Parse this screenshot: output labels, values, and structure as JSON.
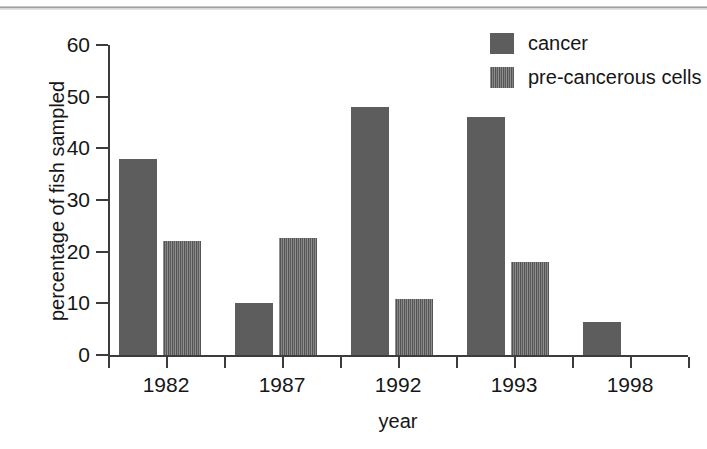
{
  "figure": {
    "background_color": "#ffffff",
    "scan_rule_color": "#8d8d8d"
  },
  "legend": {
    "position": "top-right",
    "entries": [
      {
        "label": "cancer",
        "swatch": "solid-gray-swatch-icon",
        "color": "#5d5d5d",
        "pattern": "solid"
      },
      {
        "label": "pre-cancerous cells",
        "swatch": "hatched-gray-swatch-icon",
        "color": "#5f5f5f",
        "pattern": "hatched"
      }
    ]
  },
  "axes": {
    "y_title": "percentage of fish sampled",
    "x_title": "year",
    "y_ticks": [
      "60",
      "50",
      "40",
      "30",
      "20",
      "10",
      "0"
    ],
    "x_ticks": [
      "1982",
      "1987",
      "1992",
      "1993",
      "1998"
    ]
  },
  "chart_data": {
    "type": "bar",
    "title": "",
    "subtitle": "",
    "xlabel": "year",
    "ylabel": "percentage of fish sampled",
    "categories": [
      "1982",
      "1987",
      "1992",
      "1993",
      "1998"
    ],
    "series": [
      {
        "name": "cancer",
        "pattern": "solid",
        "color": "#5d5d5d",
        "values": [
          38,
          10,
          48,
          46,
          6.4
        ]
      },
      {
        "name": "pre-cancerous cells",
        "pattern": "hatched",
        "color": "#5f5f5f",
        "values": [
          22,
          22.7,
          10.8,
          18,
          0
        ]
      }
    ],
    "ylim": [
      0,
      60
    ],
    "ytick_step": 10,
    "grid": false,
    "legend_position": "top-right",
    "annotations": []
  }
}
